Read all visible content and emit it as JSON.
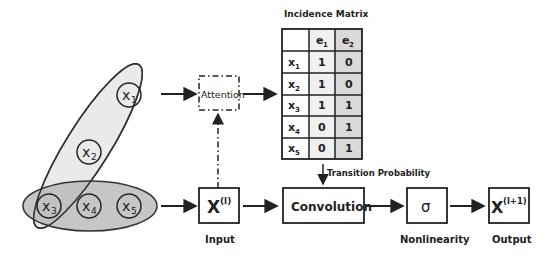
{
  "hypergraph": {
    "nodes": [
      {
        "id": "x1",
        "label": "x",
        "sub": "1"
      },
      {
        "id": "x2",
        "label": "x",
        "sub": "2"
      },
      {
        "id": "x3",
        "label": "x",
        "sub": "3"
      },
      {
        "id": "x4",
        "label": "x",
        "sub": "4"
      },
      {
        "id": "x5",
        "label": "x",
        "sub": "5"
      }
    ],
    "edges": [
      {
        "id": "e1",
        "members": [
          "x1",
          "x2",
          "x3"
        ],
        "color": "#e6e6e6"
      },
      {
        "id": "e2",
        "members": [
          "x3",
          "x4",
          "x5"
        ],
        "color": "#b3b3b3"
      }
    ]
  },
  "attention": {
    "label": "Attention"
  },
  "incidence_matrix": {
    "title": "Incidence Matrix",
    "columns": [
      "",
      "e1",
      "e2"
    ],
    "col_labels": [
      {
        "main": "e",
        "sub": "1"
      },
      {
        "main": "e",
        "sub": "2"
      }
    ],
    "rows": [
      {
        "label": "x",
        "sub": "1",
        "values": [
          "1",
          "0"
        ]
      },
      {
        "label": "x",
        "sub": "2",
        "values": [
          "1",
          "0"
        ]
      },
      {
        "label": "x",
        "sub": "3",
        "values": [
          "1",
          "1"
        ]
      },
      {
        "label": "x",
        "sub": "4",
        "values": [
          "0",
          "1"
        ]
      },
      {
        "label": "x",
        "sub": "5",
        "values": [
          "0",
          "1"
        ]
      }
    ]
  },
  "transition": {
    "label": "Transition Probability"
  },
  "pipeline": {
    "input": {
      "box": "X",
      "sup": "(l)",
      "caption": "Input"
    },
    "convolution": {
      "box": "Convolution"
    },
    "nonlinearity": {
      "box": "σ",
      "caption": "Nonlinearity"
    },
    "output": {
      "box": "X",
      "sup": "(l+1)",
      "caption": "Output"
    }
  }
}
